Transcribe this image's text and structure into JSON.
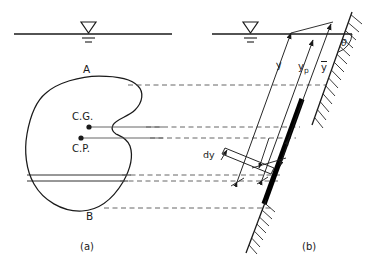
{
  "figure": {
    "type": "engineering-diagram",
    "panels": [
      {
        "id": "a",
        "caption": "(a)",
        "view": "plan view of submerged plate",
        "labels": {
          "top_edge": "A",
          "bottom_edge": "B",
          "centroid": "C.G.",
          "center_of_pressure": "C.P."
        }
      },
      {
        "id": "b",
        "caption": "(b)",
        "view": "elevation / edge view of inclined plate",
        "labels": {
          "depth_to_strip": "y",
          "depth_to_cp": "yp",
          "depth_to_cg": "y",
          "strip_thickness": "dy",
          "inclination_angle": "θ"
        }
      }
    ],
    "water_surface_symbol": "free-surface-triangle",
    "colors": {
      "line": "#1a1a1a",
      "plate_fill": "#000000",
      "dashed_projection": "#555555",
      "background": "#ffffff"
    }
  },
  "panel_a": {
    "label_A": "A",
    "label_B": "B",
    "label_cg": "C.G.",
    "label_cp": "C.P.",
    "caption": "(a)"
  },
  "panel_b": {
    "label_y": "y",
    "label_yp_base": "y",
    "label_yp_sub": "p",
    "label_ybar": "y",
    "label_dy": "dy",
    "label_theta": "θ",
    "caption": "(b)"
  }
}
